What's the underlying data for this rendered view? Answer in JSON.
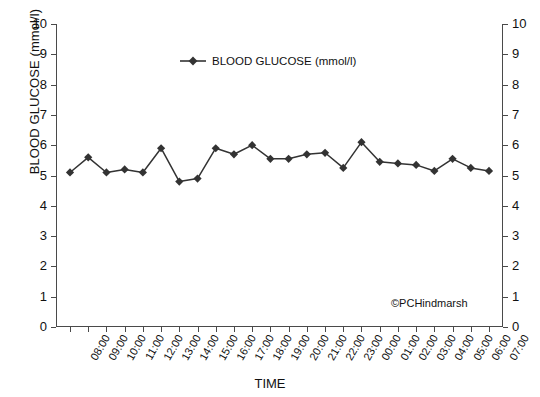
{
  "chart_data": {
    "type": "line",
    "title": "",
    "xlabel": "TIME",
    "ylabel": "BLOOD GLUCOSE (mmol/l)",
    "ylabel_right": "BLOOD GLUCOSE (mmol/l)",
    "ylim": [
      0,
      10
    ],
    "ytick_labels": [
      "10",
      "9",
      "8",
      "7",
      "6",
      "5",
      "4",
      "3",
      "2",
      "1",
      "0"
    ],
    "ytick_values": [
      10,
      9,
      8,
      7,
      6,
      5,
      4,
      3,
      2,
      1,
      0
    ],
    "dual_y_axis": true,
    "grid": false,
    "legend_position": "upper-center",
    "marker": "diamond",
    "series_color": "#333333",
    "categories": [
      "08:00",
      "09:00",
      "10:00",
      "11:00",
      "12:00",
      "13:00",
      "14:00",
      "15:00",
      "16:00",
      "17:00",
      "18:00",
      "19:00",
      "20:00",
      "21:00",
      "22:00",
      "23:00",
      "00:00",
      "01:00",
      "02:00",
      "03:00",
      "04:00",
      "05:00",
      "06:00",
      "07:00"
    ],
    "series": [
      {
        "name": "BLOOD GLUCOSE (mmol/l)",
        "values": [
          5.1,
          5.6,
          5.1,
          5.2,
          5.1,
          5.9,
          4.8,
          4.9,
          5.9,
          5.7,
          6.0,
          5.55,
          5.55,
          5.7,
          5.75,
          5.25,
          6.1,
          5.45,
          5.4,
          5.35,
          5.15,
          5.55,
          5.25,
          5.15
        ]
      }
    ],
    "annotations": [
      {
        "text": "©PCHindmarsh",
        "position": "bottom-right"
      }
    ]
  },
  "legend": {
    "entries": [
      {
        "label": "BLOOD GLUCOSE (mmol/l)",
        "color": "#333333",
        "marker": "diamond"
      }
    ]
  }
}
